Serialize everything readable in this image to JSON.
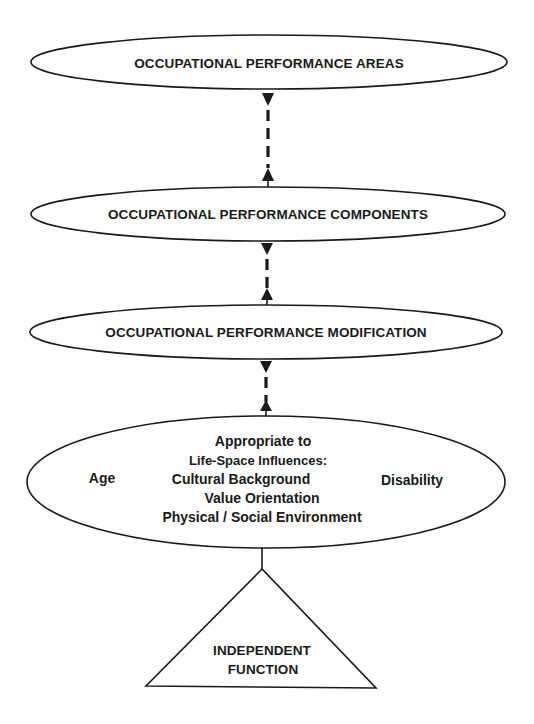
{
  "diagram": {
    "type": "hierarchical-flow",
    "nodes": [
      {
        "id": "areas",
        "shape": "ellipse",
        "label": "OCCUPATIONAL PERFORMANCE AREAS"
      },
      {
        "id": "components",
        "shape": "ellipse",
        "label": "OCCUPATIONAL PERFORMANCE COMPONENTS"
      },
      {
        "id": "modification",
        "shape": "ellipse",
        "label": "OCCUPATIONAL PERFORMANCE MODIFICATION"
      },
      {
        "id": "influences",
        "shape": "ellipse",
        "header": "Appropriate to",
        "subheader": "Life-Space Influences:",
        "left": "Age",
        "right": "Disability",
        "items": [
          "Cultural Background",
          "Value Orientation",
          "Physical / Social Environment"
        ]
      },
      {
        "id": "independent",
        "shape": "triangle",
        "lines": [
          "INDEPENDENT",
          "FUNCTION"
        ]
      }
    ],
    "edges": [
      {
        "from": "areas",
        "to": "components",
        "style": "dashed",
        "arrows": "both"
      },
      {
        "from": "components",
        "to": "modification",
        "style": "dashed",
        "arrows": "both"
      },
      {
        "from": "modification",
        "to": "influences",
        "style": "dashed",
        "arrows": "both"
      },
      {
        "from": "influences",
        "to": "independent",
        "style": "solid",
        "arrows": "none"
      }
    ]
  }
}
